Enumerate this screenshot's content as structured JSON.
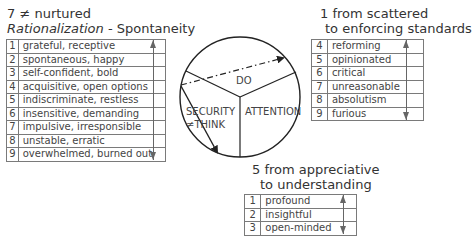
{
  "left_group": {
    "heading_line1": "7 ≠ nurtured",
    "heading_italic": "Rationalization",
    "heading_rest": " - Spontaneity",
    "rows": [
      {
        "num": "1",
        "text": "grateful, receptive"
      },
      {
        "num": "2",
        "text": "spontaneous, happy"
      },
      {
        "num": "3",
        "text": "self-confident, bold"
      },
      {
        "num": "4",
        "text": "acquisitive, open options"
      },
      {
        "num": "5",
        "text": "indiscriminate, restless"
      },
      {
        "num": "6",
        "text": "insensitive, demanding"
      },
      {
        "num": "7",
        "text": "impulsive, irresponsible"
      },
      {
        "num": "8",
        "text": "unstable, erratic"
      },
      {
        "num": "9",
        "text": "overwhelmed, burned out"
      }
    ]
  },
  "right_group": {
    "heading_line1": "1 from scattered",
    "heading_line2": "to enforcing standards",
    "rows": [
      {
        "num": "4",
        "text": "reforming"
      },
      {
        "num": "5",
        "text": "opinionated"
      },
      {
        "num": "6",
        "text": "critical"
      },
      {
        "num": "7",
        "text": "unreasonable"
      },
      {
        "num": "8",
        "text": "absolutism"
      },
      {
        "num": "9",
        "text": "furious"
      }
    ]
  },
  "bottom_group": {
    "heading_line1": "5 from appreciative",
    "heading_line2": "to understanding",
    "rows": [
      {
        "num": "1",
        "text": "profound"
      },
      {
        "num": "2",
        "text": "insightful"
      },
      {
        "num": "3",
        "text": "open-minded"
      }
    ]
  },
  "circle": {
    "segments": {
      "top": "DO",
      "left_line1": "SECURITY",
      "left_line2": "≠THINK",
      "right": "ATTENTION"
    }
  }
}
